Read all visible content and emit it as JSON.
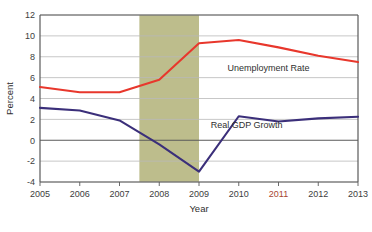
{
  "chart_data": {
    "type": "line",
    "title": "",
    "subtitle": "",
    "xlabel": "Year",
    "ylabel": "Percent",
    "x": [
      2005,
      2006,
      2007,
      2008,
      2009,
      2010,
      2011,
      2012,
      2013
    ],
    "xtick_labels": [
      "2005",
      "2006",
      "2007",
      "2008",
      "2009",
      "2010",
      "2011",
      "2012",
      "2013"
    ],
    "xlim": [
      2005,
      2013
    ],
    "ylim": [
      -4,
      12
    ],
    "ytick_labels": [
      "12",
      "10",
      "8",
      "6",
      "4",
      "2",
      "0",
      "-2",
      "-4"
    ],
    "ytick_values": [
      12,
      10,
      8,
      6,
      4,
      2,
      0,
      -2,
      -4
    ],
    "grid": true,
    "grid_axis": "y",
    "legend": "inline-annotations",
    "series": [
      {
        "name": "Unemployment Rate",
        "color": "#e8372c",
        "values": [
          5.1,
          4.6,
          4.6,
          5.8,
          9.3,
          9.6,
          8.9,
          8.1,
          7.5
        ]
      },
      {
        "name": "Real GDP Growth",
        "color": "#3b2f7a",
        "values": [
          3.1,
          2.85,
          1.9,
          -0.4,
          -3.0,
          2.3,
          1.8,
          2.1,
          2.25
        ]
      }
    ],
    "annotations": [
      {
        "text": "Unemployment Rate",
        "series": "Unemployment Rate",
        "x": 2010.75,
        "y": 6.6
      },
      {
        "text": "Real GDP Growth",
        "series": "Real GDP Growth",
        "x": 2010.2,
        "y": 1.15
      }
    ],
    "shaded_regions": [
      {
        "label": "recession-band",
        "x_start": 2007.5,
        "x_end": 2009.0,
        "color": "#bdbd8c"
      }
    ],
    "axis_color": "#5a5a5a",
    "gridline_color": "#b9b9b9",
    "background_color": "#ffffff"
  }
}
